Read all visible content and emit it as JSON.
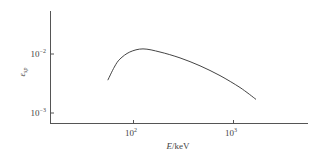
{
  "chart_data": {
    "type": "line",
    "title": "",
    "xlabel": "E/keV",
    "xlabel_var": "E",
    "xlabel_unit": "/keV",
    "ylabel": "ε_sp",
    "ylabel_symbol": "ε",
    "ylabel_sub": "sp",
    "xscale": "log",
    "yscale": "log",
    "xlim": [
      18,
      6000
    ],
    "ylim": [
      0.00075,
      0.055
    ],
    "grid": false,
    "legend": null,
    "x_ticks": [
      {
        "value": 100,
        "base": "10",
        "exp": "2"
      },
      {
        "value": 1000,
        "base": "10",
        "exp": "3"
      }
    ],
    "y_ticks": [
      {
        "value": 0.01,
        "base": "10",
        "exp": "−2"
      },
      {
        "value": 0.001,
        "base": "10",
        "exp": "−3"
      }
    ],
    "series": [
      {
        "name": "ε_sp",
        "color": "#444444",
        "x": [
          56,
          65,
          74,
          93,
          126,
          186,
          295,
          468,
          741,
          1175,
          1700
        ],
        "y": [
          0.0036,
          0.006,
          0.0082,
          0.0108,
          0.0122,
          0.0108,
          0.0086,
          0.0063,
          0.0043,
          0.0027,
          0.0017
        ]
      }
    ]
  }
}
